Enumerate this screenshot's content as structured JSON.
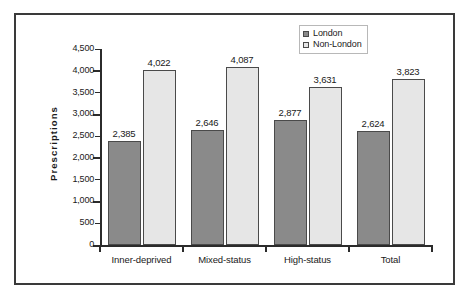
{
  "chart_data": {
    "type": "bar",
    "title": "",
    "subtitle": "",
    "xlabel": "",
    "ylabel": "Prescriptions",
    "categories": [
      "Inner-deprived",
      "Mixed-status",
      "High-status",
      "Total"
    ],
    "series": [
      {
        "name": "London",
        "color": "#8a8a8a",
        "values": [
          2385,
          2646,
          2877,
          2624
        ],
        "labels": [
          "2,385",
          "2,646",
          "2,877",
          "2,624"
        ]
      },
      {
        "name": "Non-London",
        "color": "#e6e6e6",
        "values": [
          4022,
          4087,
          3631,
          3823
        ],
        "labels": [
          "4,022",
          "4,087",
          "3,631",
          "3,823"
        ]
      }
    ],
    "ylim": [
      0,
      4500
    ],
    "ytick_values": [
      0,
      500,
      1000,
      1500,
      2000,
      2500,
      3000,
      3500,
      4000,
      4500
    ],
    "ytick_labels": [
      "0",
      "500",
      "1,000",
      "1,500",
      "2,000",
      "2,500",
      "3,000",
      "3,500",
      "4,000",
      "4,500"
    ],
    "grid": false,
    "legend_position": "top-right",
    "legend_entries": [
      "London",
      "Non-London"
    ]
  }
}
